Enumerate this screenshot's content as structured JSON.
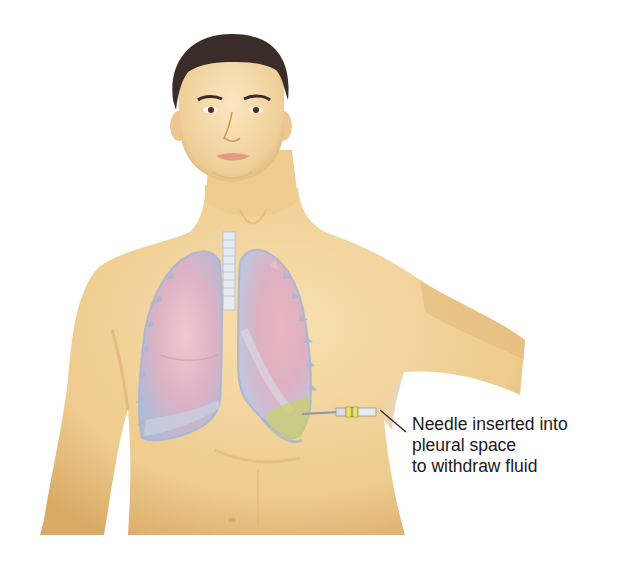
{
  "diagram": {
    "callout": {
      "lines": [
        "Needle inserted into",
        "pleural space",
        "to withdraw fluid"
      ]
    },
    "colors": {
      "background": "#ffffff",
      "skin": "#f0cf94",
      "skin_shadow": "#dcae6a",
      "hair": "#3a2c28",
      "lung_pink": "#e2b4c0",
      "lung_blue": "#b8bfd8",
      "fluid": "#c9cf6a",
      "syringe_yellow": "#f0e060",
      "leader_line": "#222222",
      "text": "#1a1a1a"
    }
  }
}
